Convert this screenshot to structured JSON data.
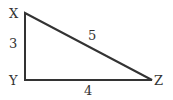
{
  "diagram": {
    "type": "right-triangle",
    "vertices": {
      "X": {
        "label": "X",
        "x": 25,
        "y": 13
      },
      "Y": {
        "label": "Y",
        "x": 25,
        "y": 80
      },
      "Z": {
        "label": "Z",
        "x": 152,
        "y": 80
      }
    },
    "sides": {
      "XY": {
        "label": "3"
      },
      "XZ": {
        "label": "5"
      },
      "YZ": {
        "label": "4"
      }
    },
    "line_color": "#333333"
  }
}
